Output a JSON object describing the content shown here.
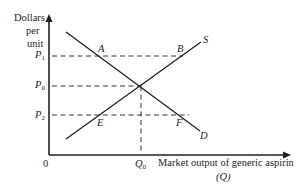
{
  "diagram": {
    "type": "supply-demand",
    "y_axis": {
      "label_lines": [
        "Dollars",
        "per",
        "unit"
      ]
    },
    "x_axis": {
      "label": "Market output of generic aspirin",
      "sublabel": "(Q)"
    },
    "origin": "0",
    "curves": [
      {
        "name": "S",
        "kind": "supply"
      },
      {
        "name": "D",
        "kind": "demand"
      }
    ],
    "price_levels": [
      {
        "symbol": "P",
        "subscript": "1"
      },
      {
        "symbol": "P",
        "subscript": "0"
      },
      {
        "symbol": "P",
        "subscript": "2"
      }
    ],
    "quantity_levels": [
      {
        "symbol": "Q",
        "subscript": "0"
      }
    ],
    "points": [
      "A",
      "B",
      "E",
      "F"
    ],
    "colors": {
      "line": "#231f20",
      "background": "#ffffff"
    }
  }
}
